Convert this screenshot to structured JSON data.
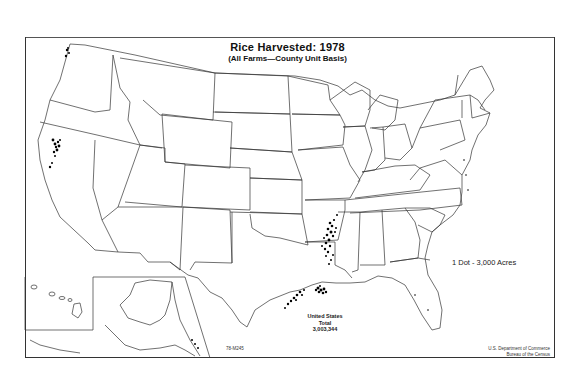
{
  "map": {
    "title": "Rice Harvested:  1978",
    "subtitle": "(All Farms—County Unit Basis)",
    "legend": "1 Dot - 3,000 Acres",
    "total": {
      "line1": "United States",
      "line2": "Total",
      "value": "3,003,344"
    },
    "map_code": "78-M245",
    "credit": {
      "line1": "U.S. Department of Commerce",
      "line2": "Bureau of the Census"
    },
    "region": "United States (contiguous, with Alaska and Hawaii insets)",
    "dot_concentrations": [
      "Sacramento Valley, California",
      "Eastern Arkansas",
      "Mississippi Delta (Mississippi/Louisiana)",
      "Southwest Louisiana",
      "Texas Gulf Coast",
      "Florida (minor)",
      "Missouri Bootheel"
    ]
  }
}
